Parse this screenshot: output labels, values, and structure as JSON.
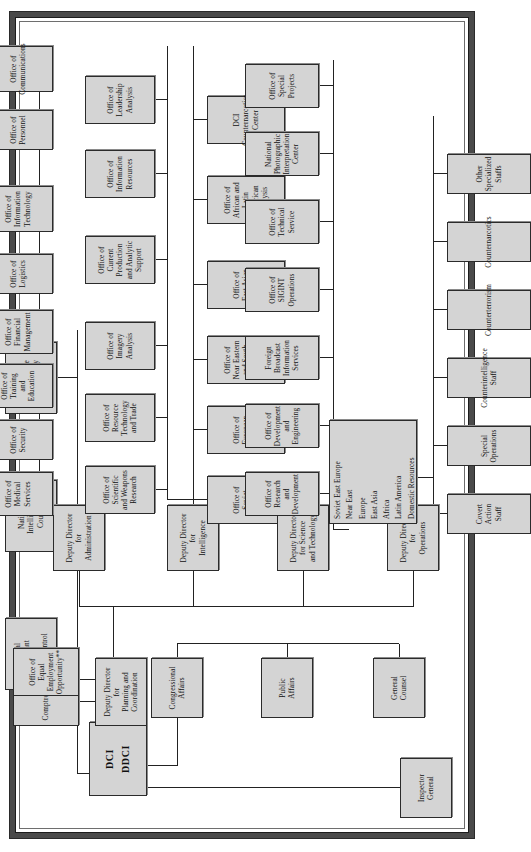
{
  "chart": {
    "type": "org-chart",
    "orientation": "rotated-90-ccw",
    "head": {
      "label_line1": "DCI",
      "label_line2": "DDCI"
    },
    "staff_left": [
      {
        "id": "inspector-general",
        "label": "Inspector\nGeneral"
      },
      {
        "id": "general-counsel",
        "label": "General\nCounsel"
      },
      {
        "id": "public-affairs",
        "label": "Public\nAffairs"
      },
      {
        "id": "congressional-affairs",
        "label": "Congressional\nAffairs"
      }
    ],
    "staff_top": [
      {
        "id": "special-assistant-arms-control",
        "label": "Special\nAssistant\nfor\nArms Control"
      },
      {
        "id": "national-intelligence-council",
        "label": "National\nIntelligence\nCouncil"
      },
      {
        "id": "director-intelligence-community-staff",
        "label": "Director\nIntelligence\nCommunity\nStaff"
      }
    ],
    "planning": {
      "id": "deputy-director-planning-coordination",
      "label": "Deputy Director\nfor\nPlanning and\nCoordination",
      "children": [
        {
          "id": "comptroller",
          "label": "Comptroller"
        },
        {
          "id": "office-equal-employment-opportunity",
          "label": "Office of Equal\nEmployment Opportunity**"
        }
      ]
    },
    "directorates": [
      {
        "id": "deputy-director-administration",
        "label": "Deputy Director\nfor\nAdministration",
        "children": [
          {
            "id": "office-medical-services",
            "label": "Office of\nMedical Services"
          },
          {
            "id": "office-security",
            "label": "Office of Security"
          },
          {
            "id": "office-training-education",
            "label": "Office of Training\nand Education"
          },
          {
            "id": "office-financial-management",
            "label": "Office of Financial\nManagement"
          },
          {
            "id": "office-logistics",
            "label": "Office of Logistics"
          },
          {
            "id": "office-information-technology",
            "label": "Office of\nInformation Technology"
          },
          {
            "id": "office-personnel",
            "label": "Office of Personnel"
          },
          {
            "id": "office-communications",
            "label": "Office of\nCommunications"
          }
        ]
      },
      {
        "id": "deputy-director-intelligence",
        "label": "Deputy Director\nfor\nIntelligence",
        "children_row1": [
          {
            "id": "office-scientific-weapons-research",
            "label": "Office of Scientific\nand Weapons Research"
          },
          {
            "id": "office-resource-technology-trade",
            "label": "Office of Resource\nTechnology and Trade"
          },
          {
            "id": "office-imagery-analysis",
            "label": "Office of\nImagery Analysis"
          },
          {
            "id": "office-current-production-analytic-support",
            "label": "Office of Current Production\nand Analytic Support"
          },
          {
            "id": "office-information-resources",
            "label": "Office of\nInformation Resources"
          },
          {
            "id": "office-leadership-analysis",
            "label": "Office of\nLeadership Analysis"
          }
        ],
        "children_row2": [
          {
            "id": "office-soviet-analysis",
            "label": "Office of\nSoviet Analysis"
          },
          {
            "id": "office-european-analysis",
            "label": "Office of\nEuropean Analysis"
          },
          {
            "id": "office-near-eastern-south-asian-analysis",
            "label": "Office of Near Eastern\nand South Asian Analysis"
          },
          {
            "id": "office-east-asian-analysis",
            "label": "Office of\nEast Asian Analysis"
          },
          {
            "id": "office-african-latin-american-analysis",
            "label": "Office of African and\nLatin American Analysis"
          },
          {
            "id": "dci-counternarcotics-center",
            "label": "DCI Counternarcotics\nCenter"
          }
        ]
      },
      {
        "id": "deputy-director-science-technology",
        "label": "Deputy Director\nfor Science\nand Technology",
        "children": [
          {
            "id": "office-research-development",
            "label": "Office of Research\nand Development"
          },
          {
            "id": "office-development-engineering",
            "label": "Office of Development\nand Engineering"
          },
          {
            "id": "foreign-broadcast-information-services",
            "label": "Foreign Broadcast\nInformation Services"
          },
          {
            "id": "office-sigint-operations",
            "label": "Office of\nSIGINT Operations"
          },
          {
            "id": "office-technical-service",
            "label": "Office of\nTechnical Service"
          },
          {
            "id": "national-photographic-interpretation-center",
            "label": "National Photographic\nInterpretation Center"
          },
          {
            "id": "office-special-projects",
            "label": "Office of\nSpecial Projects"
          }
        ]
      },
      {
        "id": "deputy-director-operations",
        "label": "Deputy Director\nfor\nOperations",
        "regions_box": {
          "id": "operations-regional-divisions",
          "items": [
            "Soviet East Europe",
            "Near East",
            "Europe",
            "East Asia",
            "Africa",
            "Latin America",
            "Domestic Resources"
          ]
        },
        "staffs": [
          {
            "id": "covert-action-staff",
            "label": "Covert Action Staff"
          },
          {
            "id": "special-operations",
            "label": "Special Operations"
          },
          {
            "id": "counterintelligence-staff",
            "label": "Counterintelligence Staff"
          },
          {
            "id": "counterterrorism",
            "label": "Counterterrorism"
          },
          {
            "id": "counternarcotics",
            "label": "Counternarcotics"
          },
          {
            "id": "other-specialized-staffs",
            "label": "Other Specialized Staffs"
          }
        ]
      }
    ],
    "colors": {
      "box_fill": "#d4d4d4",
      "box_border": "#2b2b2b",
      "line": "#222222",
      "frame": "#4a4a4a",
      "background": "#ffffff"
    }
  }
}
